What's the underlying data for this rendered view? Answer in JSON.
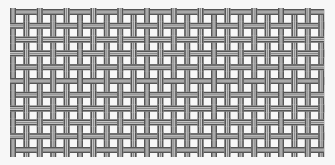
{
  "image": {
    "subject": "woven wire mesh",
    "background": "#f7f7f7",
    "strand_dark": "#555555",
    "strand_mid": "#8a8a8a",
    "strand_light": "#d8d8d8",
    "columns": 24,
    "rows": 11,
    "pitch_x": 13.4,
    "pitch_y": 13.8,
    "origin_x": 10,
    "origin_y": 9,
    "extent_right": 324,
    "extent_bottom": 157
  }
}
